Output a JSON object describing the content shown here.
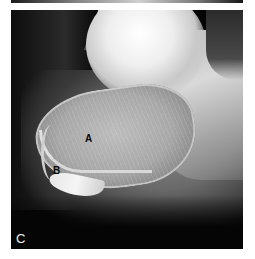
{
  "figure": {
    "panel_label": "C",
    "annotations": [
      {
        "id": "A",
        "label": "A"
      },
      {
        "id": "B",
        "label": "B"
      }
    ],
    "colors": {
      "background": "#050505",
      "bone_highlight": "#f0f0f0",
      "label_dark": "#0a0a0a",
      "label_light": "#f2f2f2",
      "page": "#ffffff"
    }
  }
}
